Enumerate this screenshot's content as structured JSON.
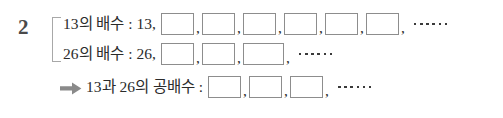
{
  "problem": {
    "number": "2"
  },
  "rows": [
    {
      "id": "multiples-of-13",
      "label": "13의 배수 : 13,",
      "boxes": 6,
      "wide_box_index": -1,
      "ellipsis_dots": 6,
      "has_arrow": false
    },
    {
      "id": "multiples-of-26",
      "label": "26의 배수 : 26,",
      "boxes": 3,
      "wide_box_index": 2,
      "ellipsis_dots": 6,
      "has_arrow": false
    },
    {
      "id": "common-multiples",
      "label": "13과 26의 공배수 :",
      "boxes": 3,
      "wide_box_index": -1,
      "ellipsis_dots": 6,
      "has_arrow": true,
      "arrow_icon": "right-arrow-icon"
    }
  ],
  "separators": {
    "comma": ","
  },
  "colors": {
    "ink": "#2b2b2b",
    "number_ink": "#4a4a4a",
    "box_border": "#8d8d8d",
    "bracket": "#a8a8a8",
    "arrow": "#8a8a8a",
    "background": "#ffffff"
  }
}
